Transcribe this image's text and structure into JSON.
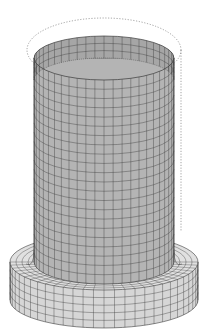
{
  "figure": {
    "colors": {
      "background": "#ffffff",
      "cylinder_fill": "#b4b4b4",
      "cylinder_inner": "#a6a6a6",
      "flange_fill": "#d6d6d6",
      "mesh_line": "#3a3a3a",
      "outline_dotted": "#8a8a8a"
    },
    "mesh": {
      "cylinder_columns": 24,
      "cylinder_rows": 22,
      "flange_columns": 28,
      "flange_rows": 5
    }
  }
}
